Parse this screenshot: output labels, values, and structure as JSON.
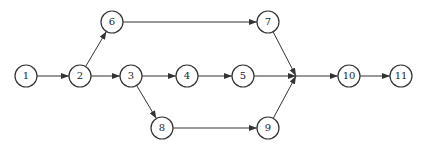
{
  "diagram": {
    "type": "activity-network",
    "stroke_color": "#333333",
    "node_radius": 11,
    "nodes": [
      {
        "id": "1",
        "label": "1",
        "x": 26,
        "y": 76
      },
      {
        "id": "2",
        "label": "2",
        "x": 80,
        "y": 76
      },
      {
        "id": "3",
        "label": "3",
        "x": 131,
        "y": 76
      },
      {
        "id": "4",
        "label": "4",
        "x": 187,
        "y": 76
      },
      {
        "id": "5",
        "label": "5",
        "x": 243,
        "y": 76
      },
      {
        "id": "6",
        "label": "6",
        "x": 112,
        "y": 22
      },
      {
        "id": "7",
        "label": "7",
        "x": 268,
        "y": 22
      },
      {
        "id": "8",
        "label": "8",
        "x": 162,
        "y": 128
      },
      {
        "id": "9",
        "label": "9",
        "x": 268,
        "y": 128
      },
      {
        "id": "10",
        "label": "10",
        "x": 349,
        "y": 76
      },
      {
        "id": "11",
        "label": "11",
        "x": 401,
        "y": 76
      }
    ],
    "junction": {
      "x": 296,
      "y": 76
    },
    "edges": [
      {
        "from": "1",
        "to": "2"
      },
      {
        "from": "2",
        "to": "6"
      },
      {
        "from": "2",
        "to": "3"
      },
      {
        "from": "3",
        "to": "4"
      },
      {
        "from": "3",
        "to": "8"
      },
      {
        "from": "4",
        "to": "5"
      },
      {
        "from": "6",
        "to": "7"
      },
      {
        "from": "8",
        "to": "9"
      },
      {
        "from": "7",
        "to": "junction"
      },
      {
        "from": "5",
        "to": "junction"
      },
      {
        "from": "9",
        "to": "junction"
      },
      {
        "from": "junction",
        "to": "10"
      },
      {
        "from": "10",
        "to": "11"
      }
    ]
  }
}
